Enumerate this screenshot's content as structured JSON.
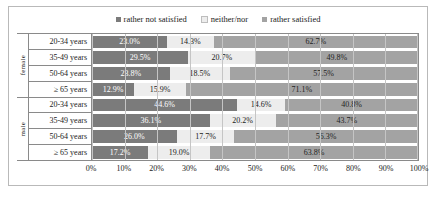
{
  "chart_data": {
    "type": "bar",
    "subtype": "stacked-horizontal-100",
    "title": "",
    "xlabel": "",
    "ylabel": "",
    "xlim": [
      0,
      100
    ],
    "grid": true,
    "legend_position": "top-center",
    "legend": [
      "rather not satisfied",
      "neither/nor",
      "rather satisfied"
    ],
    "series": [
      {
        "name": "rather not satisfied",
        "color": "#7b7b7b",
        "values": [
          23.0,
          29.5,
          23.8,
          12.9,
          44.6,
          36.1,
          26.0,
          17.2
        ]
      },
      {
        "name": "neither/nor",
        "color": "#ededed",
        "values": [
          14.3,
          20.7,
          18.5,
          15.9,
          14.6,
          20.2,
          17.7,
          19.0
        ]
      },
      {
        "name": "rather satisfied",
        "color": "#a3a3a3",
        "values": [
          62.7,
          49.8,
          57.5,
          71.1,
          40.8,
          43.7,
          56.3,
          63.8
        ]
      }
    ],
    "categories": [
      "20-34 years",
      "35-49 years",
      "50-64 years",
      "≥ 65 years",
      "20-34 years",
      "35-49 years",
      "50-64 years",
      "≥ 65 years"
    ],
    "groups": [
      {
        "label": "female",
        "rows": 4
      },
      {
        "label": "male",
        "rows": 4
      }
    ],
    "value_labels": [
      [
        "23.0%",
        "14.3%",
        "62.7%"
      ],
      [
        "29.5%",
        "20.7%",
        "49.8%"
      ],
      [
        "23.8%",
        "18.5%",
        "57.5%"
      ],
      [
        "12.9%",
        "15.9%",
        "71.1%"
      ],
      [
        "44.6%",
        "14.6%",
        "40.8%"
      ],
      [
        "36.1%",
        "20.2%",
        "43.7%"
      ],
      [
        "26.0%",
        "17.7%",
        "56.3%"
      ],
      [
        "17.2%",
        "19.0%",
        "63.8%"
      ]
    ],
    "xticks": [
      0,
      10,
      20,
      30,
      40,
      50,
      60,
      70,
      80,
      90,
      100
    ],
    "xtick_labels": [
      "0%",
      "10%",
      "20%",
      "30%",
      "40%",
      "50%",
      "60%",
      "70%",
      "80%",
      "90%",
      "100%"
    ]
  }
}
